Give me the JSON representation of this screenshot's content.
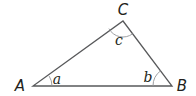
{
  "diagram": {
    "type": "triangle",
    "vertices": [
      {
        "label": "A",
        "x": 33,
        "y": 86,
        "label_x": 20,
        "label_y": 91
      },
      {
        "label": "B",
        "x": 172,
        "y": 86,
        "label_x": 182,
        "label_y": 91
      },
      {
        "label": "C",
        "x": 123,
        "y": 21,
        "label_x": 123,
        "label_y": 15
      }
    ],
    "angles": [
      {
        "label": "a",
        "vertex": "A",
        "label_x": 57,
        "label_y": 84
      },
      {
        "label": "b",
        "vertex": "B",
        "label_x": 148,
        "label_y": 82
      },
      {
        "label": "c",
        "vertex": "C",
        "label_x": 119,
        "label_y": 45
      }
    ],
    "colors": {
      "stroke": "#58595b",
      "arc": "#939598",
      "text": "#231f20",
      "background": "#ffffff"
    }
  }
}
